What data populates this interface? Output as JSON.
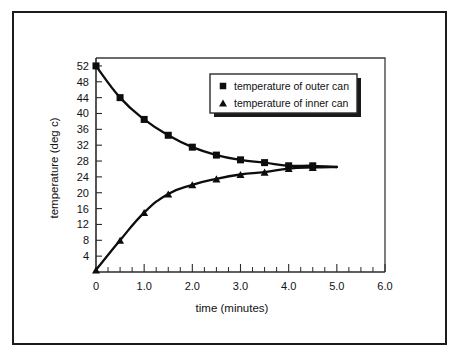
{
  "figure": {
    "frame_border_color": "#1b1b1b",
    "background_color": "#ffffff",
    "ink_color": "#0d0d0d"
  },
  "chart_data": {
    "type": "line",
    "title": "",
    "xlabel": "time (minutes)",
    "ylabel": "temperature (deg c)",
    "xlim": [
      0,
      6.0
    ],
    "ylim": [
      0,
      54
    ],
    "grid": false,
    "legend_position": "upper right",
    "x_tick_labels": [
      "0",
      "1.0",
      "2.0",
      "3.0",
      "4.0",
      "5.0",
      "6.0"
    ],
    "x_tick_values": [
      0,
      1,
      2,
      3,
      4,
      5,
      6
    ],
    "x_minor_tick_step": 0.25,
    "y_tick_labels": [
      "4",
      "8",
      "12",
      "16",
      "20",
      "24",
      "28",
      "32",
      "36",
      "40",
      "44",
      "48",
      "52"
    ],
    "y_tick_values": [
      4,
      8,
      12,
      16,
      20,
      24,
      28,
      32,
      36,
      40,
      44,
      48,
      52
    ],
    "x": [
      0,
      0.5,
      1.0,
      1.5,
      2.0,
      2.5,
      3.0,
      3.5,
      4.0,
      4.5,
      5.0
    ],
    "series": [
      {
        "name": "temperature of outer can",
        "marker": "square",
        "values": [
          52.0,
          44.0,
          38.5,
          34.5,
          31.5,
          29.5,
          28.3,
          27.6,
          26.8,
          26.8,
          26.5
        ]
      },
      {
        "name": "temperature of inner can",
        "marker": "triangle",
        "values": [
          0.5,
          8.0,
          15.0,
          19.7,
          22.0,
          23.5,
          24.6,
          25.2,
          26.1,
          26.4,
          26.5
        ]
      }
    ]
  },
  "legend": {
    "entries": [
      {
        "marker": "square",
        "label": "temperature of outer can"
      },
      {
        "marker": "triangle",
        "label": "temperature of inner can"
      }
    ]
  },
  "axes": {
    "x_title": "time (minutes)",
    "y_title": "temperature (deg c)"
  }
}
